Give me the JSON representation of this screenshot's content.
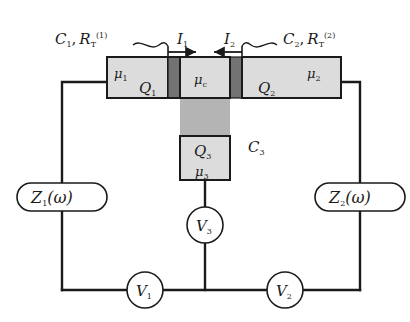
{
  "figure": {
    "type": "circuit-diagram"
  },
  "colors": {
    "line": "#1a1a1a",
    "electrode_fill": "#dcdcdc",
    "junction_fill": "#808080",
    "gate_column_fill": "#b4b4b4",
    "background": "#ffffff"
  },
  "labels": {
    "junction1": "C",
    "junction1_sub": "1",
    "junction1_sep": ",",
    "junction1_r": "R",
    "junction1_r_sub": "T",
    "junction1_r_sup": "(1)",
    "junction2": "C",
    "junction2_sub": "2",
    "junction2_sep": ",",
    "junction2_r": "R",
    "junction2_r_sub": "T",
    "junction2_r_sup": "(2)",
    "current1": "I",
    "current1_sub": "1",
    "current2": "I",
    "current2_sub": "2",
    "mu1": "μ",
    "mu1_sub": "1",
    "mu_c": "μ",
    "mu_c_sub": "c",
    "mu2": "μ",
    "mu2_sub": "2",
    "mu3": "μ",
    "mu3_sub": "3",
    "charge1": "Q",
    "charge1_sub": "1",
    "charge2": "Q",
    "charge2_sub": "2",
    "charge3": "Q",
    "charge3_sub": "3",
    "cap3": "C",
    "cap3_sub": "3",
    "impedance1": "Z",
    "impedance1_sub": "1",
    "impedance1_arg": "(ω)",
    "impedance2": "Z",
    "impedance2_sub": "2",
    "impedance2_arg": "(ω)",
    "voltage1": "V",
    "voltage1_sub": "1",
    "voltage2": "V",
    "voltage2_sub": "2",
    "voltage3": "V",
    "voltage3_sub": "3"
  },
  "elements": {
    "left_electrode": "Left lead electrode",
    "right_electrode": "Right lead electrode",
    "island": "Central island",
    "gate_island": "Gate island",
    "tunnel_junction_1": "Tunnel junction 1",
    "tunnel_junction_2": "Tunnel junction 2",
    "gate_capacitor": "Gate capacitor C3"
  }
}
